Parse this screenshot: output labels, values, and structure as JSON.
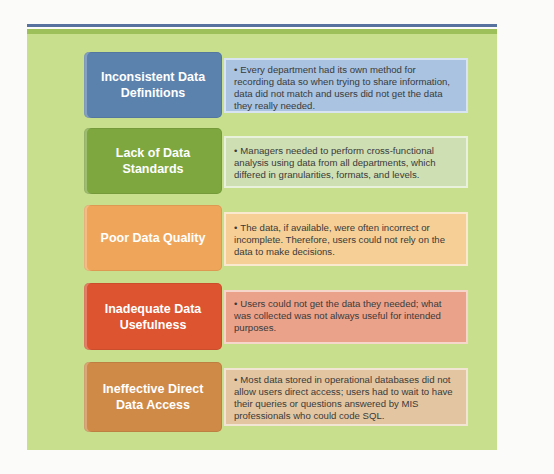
{
  "colors": {
    "top_rule": "#5872a0",
    "panel_bg": "#c8df8e",
    "panel_band": "#9dc05a"
  },
  "rows": [
    {
      "label": "Inconsistent Data Definitions",
      "description": "Every department had its own method for recording data so when trying to share information, data did not match and users did not get the data they really needed.",
      "label_color": "#5b82ad",
      "desc_color": "#a9c3e0"
    },
    {
      "label": "Lack of Data Standards",
      "description": "Managers needed to perform cross-functional analysis using data from all departments, which differed in granularities, formats, and levels.",
      "label_color": "#7ea83f",
      "desc_color": "#cfdfb4"
    },
    {
      "label": "Poor Data Quality",
      "description": "The data, if available, were often incorrect or incomplete. Therefore, users could not rely on the data to make decisions.",
      "label_color": "#f0a65a",
      "desc_color": "#f5cf96"
    },
    {
      "label": "Inadequate Data Usefulness",
      "description": "Users could not get the data they needed; what was collected was not always useful for intended purposes.",
      "label_color": "#dc5530",
      "desc_color": "#eba28a"
    },
    {
      "label": "Ineffective Direct Data Access",
      "description": "Most data stored in operational databases did not allow users direct access; users had to wait to have their queries or questions answered by MIS professionals who could code SQL.",
      "label_color": "#cf8a48",
      "desc_color": "#e3c6a1"
    }
  ],
  "bullet_glyph": "•"
}
